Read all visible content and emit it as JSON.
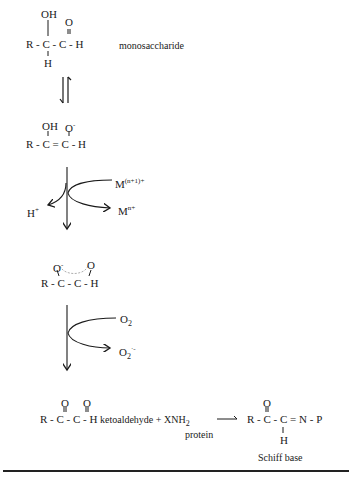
{
  "structures": {
    "monosaccharide": {
      "top_left": "OH",
      "top_right": "O",
      "main": "R - C - C - H",
      "bottom": "H",
      "label": "monosaccharide"
    },
    "enediol": {
      "top_left": "OH",
      "top_right": "O",
      "top_right_charge": "-",
      "main": "R - C = C - H"
    },
    "metal_step": {
      "reactant": "M",
      "reactant_charge": "(n+1)+",
      "product": "M",
      "product_charge": "n+",
      "released": "H",
      "released_charge": "+"
    },
    "radical_intermediate": {
      "top_left": "O",
      "top_left_charge": "-",
      "top_right": "O",
      "main": "R - C - C - H"
    },
    "oxygen_step": {
      "reactant": "O",
      "reactant_sub": "2",
      "product": "O",
      "product_sub": "2",
      "product_charge": "·-"
    },
    "ketoaldehyde": {
      "top_left": "O",
      "top_right": "O",
      "main": "R - C - C - H",
      "label": "ketoaldehyde + XNH",
      "label_sub": "2",
      "protein_label": "protein"
    },
    "schiff_base": {
      "top": "O",
      "main": "R - C - C = N - P",
      "bottom": "H",
      "label": "Schiff base"
    }
  }
}
